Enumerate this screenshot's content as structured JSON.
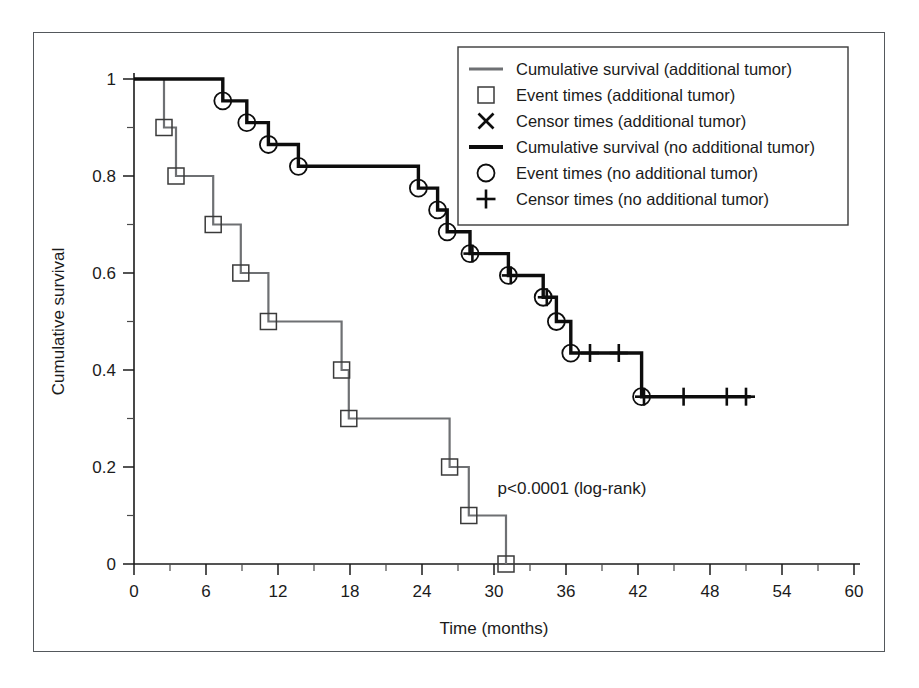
{
  "chart_data": {
    "type": "line",
    "title": "",
    "xlabel": "Time (months)",
    "ylabel": "Cumulative survival",
    "xlim": [
      0,
      60
    ],
    "ylim": [
      0,
      1
    ],
    "xticks": [
      0,
      6,
      12,
      18,
      24,
      30,
      36,
      42,
      48,
      54,
      60
    ],
    "xtick_labels": [
      "0",
      "6",
      "12",
      "18",
      "24",
      "30",
      "36",
      "42",
      "48",
      "54",
      "60"
    ],
    "x_minor_step": 3,
    "yticks": [
      0,
      0.2,
      0.4,
      0.6,
      0.8,
      1
    ],
    "ytick_labels": [
      "0",
      "0.2",
      "0.4",
      "0.6",
      "0.8",
      "1"
    ],
    "y_minor_step": 0.1,
    "grid": false,
    "annotation": "p<0.0001 (log-rank)",
    "legend_position": "top-right",
    "series": [
      {
        "name": "Cumulative survival (additional tumor)",
        "style": "step",
        "color": "#6e7073",
        "marker": "square",
        "x": [
          0.0,
          2.5,
          3.5,
          6.6,
          8.9,
          11.2,
          17.3,
          17.9,
          26.3,
          27.9,
          31.0
        ],
        "y": [
          1.0,
          0.9,
          0.8,
          0.7,
          0.6,
          0.5,
          0.4,
          0.3,
          0.2,
          0.1,
          0.0
        ]
      },
      {
        "name": "Cumulative survival (no additional tumor)",
        "style": "step",
        "color": "#0d0d0d",
        "marker": "circle",
        "x": [
          0.0,
          7.4,
          9.4,
          11.2,
          13.7,
          23.7,
          25.3,
          26.1,
          28.0,
          31.2,
          34.1,
          35.2,
          36.4,
          42.3
        ],
        "y": [
          1.0,
          0.955,
          0.91,
          0.865,
          0.82,
          0.775,
          0.73,
          0.685,
          0.64,
          0.595,
          0.55,
          0.5,
          0.435,
          0.345
        ]
      }
    ],
    "event_markers": [
      {
        "name": "Event times (additional tumor)",
        "marker": "square",
        "x": [
          2.5,
          3.5,
          6.6,
          8.9,
          11.2,
          17.3,
          17.9,
          26.3,
          27.9,
          31.0
        ],
        "y": [
          0.9,
          0.8,
          0.7,
          0.6,
          0.5,
          0.4,
          0.3,
          0.2,
          0.1,
          0.0
        ]
      },
      {
        "name": "Event times (no additional tumor)",
        "marker": "circle",
        "x": [
          7.4,
          9.4,
          11.2,
          13.7,
          23.7,
          25.3,
          26.1,
          28.0,
          31.2,
          34.1,
          35.2,
          36.4,
          42.3
        ],
        "y": [
          0.955,
          0.91,
          0.865,
          0.82,
          0.775,
          0.73,
          0.685,
          0.64,
          0.595,
          0.55,
          0.5,
          0.435,
          0.345
        ]
      }
    ],
    "censor_markers": [
      {
        "name": "Censor times (additional tumor)",
        "marker": "cross",
        "x": [],
        "y": []
      },
      {
        "name": "Censor times (no additional tumor)",
        "marker": "plus",
        "x": [
          28.2,
          31.4,
          34.4,
          38.0,
          40.4,
          42.5,
          45.8,
          49.4,
          51.0
        ],
        "y": [
          0.64,
          0.595,
          0.55,
          0.435,
          0.435,
          0.345,
          0.345,
          0.345,
          0.345
        ]
      }
    ]
  },
  "legend": {
    "entries": [
      {
        "label": "Cumulative survival (additional tumor)",
        "symbol": "line-gray"
      },
      {
        "label": "Event times (additional tumor)",
        "symbol": "square"
      },
      {
        "label": "Censor times (additional tumor)",
        "symbol": "cross"
      },
      {
        "label": "Cumulative survival (no additional tumor)",
        "symbol": "line-black"
      },
      {
        "label": "Event times (no additional tumor)",
        "symbol": "circle"
      },
      {
        "label": "Censor times (no additional tumor)",
        "symbol": "plus"
      }
    ]
  },
  "colors": {
    "gray_series": "#6e7073",
    "black_series": "#0d0d0d",
    "frame": "#54585c",
    "background": "#ffffff"
  }
}
